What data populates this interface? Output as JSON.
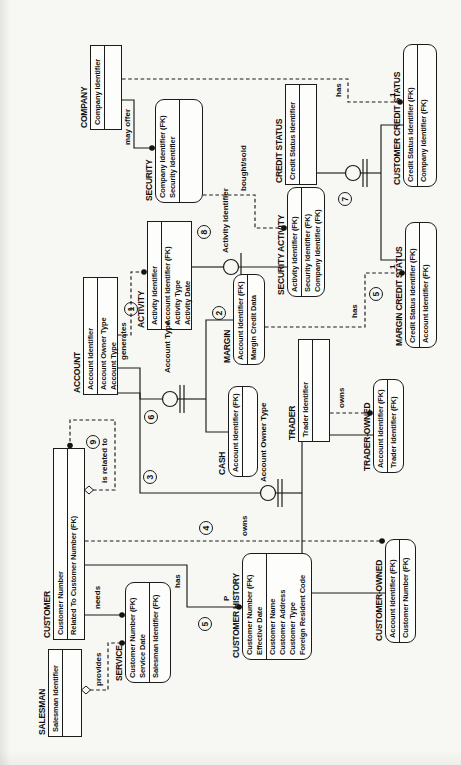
{
  "diagram": {
    "notation": "IDEF1X entity-relationship diagram",
    "orientation": "page rotated 90 degrees counter-clockwise",
    "colors": {
      "ink": "#1b1b1b",
      "paper": "#f7f7f4",
      "box_fill": "#fdfdfb"
    },
    "entities": [
      {
        "title": "SALESMAN",
        "kind": "independent",
        "x": 28,
        "y": 48,
        "w": 88,
        "h": 34,
        "key": [
          "Salesman Identifier"
        ],
        "nonkey": []
      },
      {
        "title": "CUSTOMER",
        "kind": "independent",
        "x": 125,
        "y": 53,
        "w": 192,
        "h": 32,
        "key": [
          "Customer Number"
        ],
        "nonkey": [
          "Related To Customer Number (FK)"
        ]
      },
      {
        "title": "ACCOUNT",
        "kind": "independent",
        "x": 370,
        "y": 83,
        "w": 118,
        "h": 35,
        "key": [
          "Account Identifier"
        ],
        "nonkey": [
          "Account Owner Type",
          "Account Type"
        ]
      },
      {
        "title": "COMPANY",
        "kind": "independent",
        "x": 635,
        "y": 90,
        "w": 85,
        "h": 32,
        "key": [
          "Company Identifier"
        ],
        "nonkey": []
      },
      {
        "title": "SERVICE",
        "kind": "dependent",
        "x": 82,
        "y": 125,
        "w": 101,
        "h": 46,
        "key": [
          "Customer Number (FK)",
          "Service Date"
        ],
        "nonkey": [
          "Salesman Identifier (FK)"
        ]
      },
      {
        "title": "ACTIVITY",
        "kind": "independent",
        "x": 435,
        "y": 147,
        "w": 109,
        "h": 45,
        "key": [
          "Activity Identifier"
        ],
        "nonkey": [
          "Account Identifier (FK)",
          "Activity Type",
          "Activity Date"
        ]
      },
      {
        "title": "SECURITY",
        "kind": "dependent",
        "x": 562,
        "y": 155,
        "w": 104,
        "h": 48,
        "key": [
          "Company Identifier (FK)",
          "Security Identifier"
        ],
        "nonkey": []
      },
      {
        "title": "CUSTOMER HISTORY",
        "kind": "dependent",
        "x": 105,
        "y": 242,
        "w": 107,
        "h": 70,
        "key": [
          "Customer Number (FK)",
          "Effective Date"
        ],
        "nonkey": [
          "Customer Name",
          "Customer Address",
          "Customer Type",
          "Foreign Resident Code"
        ]
      },
      {
        "title": "CASH",
        "kind": "dependent",
        "x": 288,
        "y": 228,
        "w": 91,
        "h": 30,
        "key": [
          "Account Identifier (FK)"
        ],
        "nonkey": []
      },
      {
        "title": "MARGIN",
        "kind": "dependent",
        "x": 400,
        "y": 233,
        "w": 91,
        "h": 32,
        "key": [
          "Account Identifier (FK)"
        ],
        "nonkey": [
          "Margin Credit Data"
        ]
      },
      {
        "title": "TRADER",
        "kind": "independent",
        "x": 323,
        "y": 298,
        "w": 103,
        "h": 32,
        "key": [
          "Trader Identifier"
        ],
        "nonkey": []
      },
      {
        "title": "SECURITY ACTIVITY",
        "kind": "dependent",
        "x": 468,
        "y": 287,
        "w": 110,
        "h": 38,
        "key": [
          "Activity Identifier (FK)"
        ],
        "nonkey": [
          "Security Identifier (FK)",
          "Company Identifier (FK)"
        ]
      },
      {
        "title": "CREDIT STATUS",
        "kind": "independent",
        "x": 580,
        "y": 285,
        "w": 101,
        "h": 32,
        "key": [
          "Credit Status Identifier"
        ],
        "nonkey": []
      },
      {
        "title": "TRADER-OWNED",
        "kind": "dependent",
        "x": 292,
        "y": 373,
        "w": 94,
        "h": 31,
        "key": [
          "Account Identifier (FK)"
        ],
        "nonkey": [
          "Trader Identifier (FK)"
        ]
      },
      {
        "title": "CUSTOMER-OWNED",
        "kind": "dependent",
        "x": 122,
        "y": 385,
        "w": 104,
        "h": 31,
        "key": [
          "Account Identifier (FK)"
        ],
        "nonkey": [
          "Customer Number (FK)"
        ]
      },
      {
        "title": "MARGIN CREDIT STATUS",
        "kind": "dependent",
        "x": 417,
        "y": 405,
        "w": 126,
        "h": 32,
        "key": [
          "Credit Status Identifier (FK)"
        ],
        "nonkey": [
          "Account Identifier (FK)"
        ]
      },
      {
        "title": "CUSTOMER CREDIT STATUS",
        "kind": "dependent",
        "x": 578,
        "y": 403,
        "w": 143,
        "h": 34,
        "key": [
          "Credit Status Identifier (FK)"
        ],
        "nonkey": [
          "Company Identifier (FK)"
        ]
      }
    ],
    "labels": [
      {
        "name": "may-offer",
        "text": "may offer",
        "x": 620,
        "y": 123
      },
      {
        "name": "generates",
        "text": "generates",
        "x": 405,
        "y": 119
      },
      {
        "name": "category-account-type",
        "text": "Account Type",
        "x": 392,
        "y": 163
      },
      {
        "name": "category-account-owner-type",
        "text": "Account Owner Type",
        "x": 283,
        "y": 259
      },
      {
        "name": "category-activity-identifier",
        "text": "Activity Identifier",
        "x": 512,
        "y": 221
      },
      {
        "name": "bought-sold",
        "text": "bought/sold",
        "x": 574,
        "y": 239
      },
      {
        "name": "has-customer-credit-status",
        "text": "has",
        "x": 668,
        "y": 334
      },
      {
        "name": "cardinality-1-customer-credit-status",
        "text": "1",
        "x": 668,
        "y": 388
      },
      {
        "name": "has-margin-credit-status",
        "text": "has",
        "x": 447,
        "y": 350
      },
      {
        "name": "cardinality-1-margin-credit-status",
        "text": "1",
        "x": 496,
        "y": 388
      },
      {
        "name": "owns-trader",
        "text": "owns",
        "x": 357,
        "y": 337
      },
      {
        "name": "owns-customer",
        "text": "owns",
        "x": 229,
        "y": 240
      },
      {
        "name": "is-related-to",
        "text": "is related to",
        "x": 282,
        "y": 100
      },
      {
        "name": "has-customer-history",
        "text": "has",
        "x": 177,
        "y": 173
      },
      {
        "name": "cardinality-p-customer-history",
        "text": "P",
        "x": 164,
        "y": 222
      },
      {
        "name": "needs",
        "text": "needs",
        "x": 156,
        "y": 93
      },
      {
        "name": "provides",
        "text": "provides",
        "x": 79,
        "y": 94
      }
    ],
    "circled_numbers": [
      {
        "n": "1",
        "x": 456,
        "y": 131
      },
      {
        "n": "2",
        "x": 452,
        "y": 219
      },
      {
        "n": "3",
        "x": 288,
        "y": 150
      },
      {
        "n": "4",
        "x": 237,
        "y": 206
      },
      {
        "n": "5",
        "x": 141,
        "y": 205
      },
      {
        "n": "5",
        "x": 471,
        "y": 376
      },
      {
        "n": "6",
        "x": 348,
        "y": 151
      },
      {
        "n": "7",
        "x": 566,
        "y": 345
      },
      {
        "n": "8",
        "x": 533,
        "y": 204
      },
      {
        "n": "9",
        "x": 323,
        "y": 93
      }
    ]
  }
}
